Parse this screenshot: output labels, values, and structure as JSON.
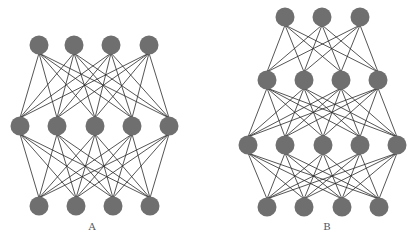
{
  "figure": {
    "width": 420,
    "height": 243,
    "node_color": "#6f6f6f",
    "edge_color": "#2a2a2a",
    "node_radius": 9.5,
    "panels": [
      {
        "id": "A",
        "label": "A",
        "label_pos": {
          "x": 92,
          "y": 222
        },
        "layer_sizes": [
          4,
          5,
          4
        ],
        "layers": [
          {
            "y": 45,
            "xs": [
              39,
              74,
              111,
              149
            ]
          },
          {
            "y": 126,
            "xs": [
              20,
              57,
              95,
              132,
              169
            ]
          },
          {
            "y": 206,
            "xs": [
              39,
              76,
              113,
              150
            ]
          }
        ]
      },
      {
        "id": "B",
        "label": "B",
        "label_pos": {
          "x": 327,
          "y": 222
        },
        "layer_sizes": [
          3,
          4,
          5,
          4
        ],
        "layers": [
          {
            "y": 17,
            "xs": [
              285,
              322,
              360
            ]
          },
          {
            "y": 80,
            "xs": [
              267,
              304,
              341,
              378
            ]
          },
          {
            "y": 145,
            "xs": [
              248,
              285,
              323,
              360,
              397
            ]
          },
          {
            "y": 207,
            "xs": [
              267,
              304,
              342,
              379
            ]
          }
        ]
      }
    ]
  }
}
